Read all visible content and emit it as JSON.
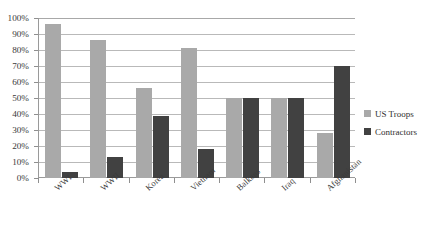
{
  "chart_data": {
    "type": "bar",
    "title": "",
    "xlabel": "",
    "ylabel": "",
    "ylim": [
      0,
      100
    ],
    "grid": true,
    "legend_position": "right",
    "categories": [
      "WWI",
      "WWII",
      "Korea",
      "Vietnam",
      "Balkans",
      "Iraq",
      "Afghanistan"
    ],
    "ytick_labels": [
      "100%",
      "90%",
      "80%",
      "70%",
      "60%",
      "50%",
      "40%",
      "30%",
      "20%",
      "10%",
      "0%"
    ],
    "ytick_values": [
      100,
      90,
      80,
      70,
      60,
      50,
      40,
      30,
      20,
      10,
      0
    ],
    "series": [
      {
        "name": "US Troops",
        "color": "#a9a9a9",
        "values": [
          96,
          86,
          56,
          81,
          50,
          50,
          28
        ]
      },
      {
        "name": "Contractors",
        "color": "#414141",
        "values": [
          4,
          13,
          39,
          18,
          50,
          50,
          70
        ]
      }
    ]
  },
  "legend": {
    "items": [
      {
        "label": "US Troops",
        "color": "#a9a9a9"
      },
      {
        "label": "Contractors",
        "color": "#414141"
      }
    ]
  }
}
